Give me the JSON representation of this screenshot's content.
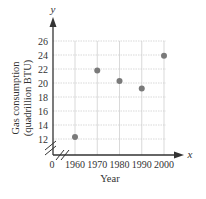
{
  "chart_data": {
    "type": "scatter",
    "title": "",
    "xlabel": "Year",
    "ylabel_line1": "Gas consumption",
    "ylabel_line2": "(quadrillion BTU)",
    "x_axis_var": "x",
    "y_axis_var": "y",
    "origin_label": "0",
    "x": [
      1960,
      1970,
      1980,
      1990,
      2000
    ],
    "y": [
      12.3,
      21.8,
      20.3,
      19.2,
      23.9
    ],
    "x_ticks": [
      "1960",
      "1970",
      "1980",
      "1990",
      "2000"
    ],
    "y_ticks": [
      "12",
      "14",
      "16",
      "18",
      "20",
      "22",
      "24",
      "26"
    ],
    "ylim": [
      12,
      26
    ],
    "xlim": [
      1960,
      2000
    ],
    "grid": true,
    "axis_break": true,
    "legend": null,
    "colors": {
      "point": "#7a7a7a",
      "axis": "#333333",
      "grid": "#cfcfcf"
    }
  }
}
